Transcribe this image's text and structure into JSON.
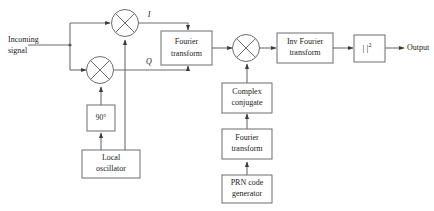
{
  "diagram": {
    "stroke_color": "#6d6d6d",
    "text_color": "#1a1a1a",
    "background": "#ffffff",
    "input_label": {
      "line1": "Incoming",
      "line2": "signal"
    },
    "output_label": "Output",
    "signal_labels": {
      "inphase": "I",
      "quadrature": "Q"
    },
    "blocks": [
      {
        "id": "fourier-transform-top",
        "line1": "Fourier",
        "line2": "transform"
      },
      {
        "id": "inv-fourier-transform",
        "line1": "Inv Fourier",
        "line2": "transform"
      },
      {
        "id": "magnitude-squared",
        "line1": "| |",
        "sup": "2"
      },
      {
        "id": "complex-conjugate",
        "line1": "Complex",
        "line2": "conjugate"
      },
      {
        "id": "fourier-transform-bottom",
        "line1": "Fourier",
        "line2": "transform"
      },
      {
        "id": "prn-code-generator",
        "line1": "PRN code",
        "line2": "generator"
      },
      {
        "id": "phase-shift-90",
        "line1": "90°"
      },
      {
        "id": "local-oscillator",
        "line1": "Local",
        "line2": "oscillator"
      }
    ],
    "mixers": [
      {
        "id": "mixer-inphase"
      },
      {
        "id": "mixer-quadrature"
      },
      {
        "id": "mixer-correlate"
      }
    ]
  }
}
